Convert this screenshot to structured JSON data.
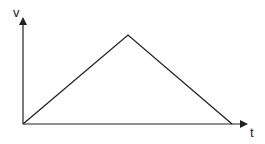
{
  "diagram": {
    "type": "velocity-time graph",
    "axes": {
      "y_label": "v",
      "x_label": "t"
    },
    "shape": "triangle",
    "points": [
      {
        "t": 0,
        "v": 0
      },
      {
        "t": 0.5,
        "v": 1
      },
      {
        "t": 1,
        "v": 0
      }
    ],
    "colors": {
      "line": "#222222",
      "background": "#ffffff"
    }
  }
}
